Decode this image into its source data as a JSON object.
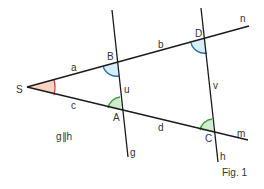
{
  "figure": {
    "caption": "Fig. 1",
    "parallel_note": "g∥h",
    "points": {
      "S": "S",
      "A": "A",
      "B": "B",
      "C": "C",
      "D": "D"
    },
    "segments": {
      "a": "a",
      "b": "b",
      "c": "c",
      "d": "d",
      "u": "u",
      "v": "v"
    },
    "lines": {
      "g": "g",
      "h": "h",
      "m": "m",
      "n": "n"
    },
    "colors": {
      "angle_S_fill": "#f9d3c4",
      "angle_S_stroke": "#c0392b",
      "angle_blue_fill": "#d6eef8",
      "angle_blue_stroke": "#2e6fa7",
      "angle_green_fill": "#cfeccf",
      "angle_green_stroke": "#3c9a3c",
      "line": "#1a1a1a"
    }
  }
}
